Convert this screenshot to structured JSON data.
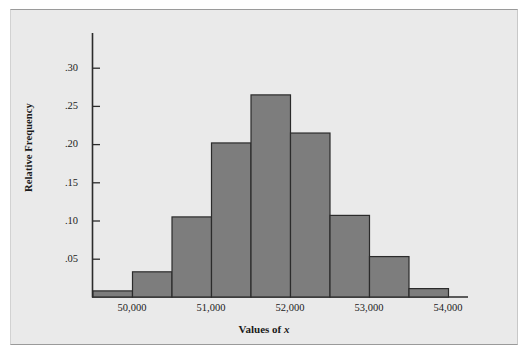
{
  "figure": {
    "background_color": "#eaeaea",
    "frame_color": "#9a9a9a"
  },
  "chart_data": {
    "type": "bar",
    "title": "",
    "subtitle": "",
    "xlabel": "Values of x",
    "xlabel_plain": "Values of ",
    "xlabel_italic": "x",
    "ylabel": "Relative Frequency",
    "categories": [
      "49,500-50,000",
      "50,000-50,500",
      "50,500-51,000",
      "51,000-51,500",
      "51,500-52,000",
      "52,000-52,500",
      "52,500-53,000",
      "53,000-53,500",
      "53,500-54,000"
    ],
    "bin_edges": [
      49500,
      50000,
      50500,
      51000,
      51500,
      52000,
      52500,
      53000,
      53500,
      54000
    ],
    "values": [
      0.008,
      0.033,
      0.105,
      0.202,
      0.265,
      0.215,
      0.107,
      0.053,
      0.011
    ],
    "x_tick_labels": [
      "50,000",
      "51,000",
      "52,000",
      "53,000",
      "54,000"
    ],
    "x_tick_values": [
      50000,
      51000,
      52000,
      53000,
      54000
    ],
    "y_tick_labels": [
      ".05",
      ".10",
      ".15",
      ".20",
      ".25",
      ".30"
    ],
    "y_tick_values": [
      0.05,
      0.1,
      0.15,
      0.2,
      0.25,
      0.3
    ],
    "ylim": [
      0,
      0.325
    ],
    "xlim": [
      49500,
      54000
    ],
    "grid": false,
    "legend": null,
    "bar_fill_color": "#7d7d7d",
    "bar_edge_color": "#2b2b2b",
    "axis_color": "#2b2b2b"
  }
}
